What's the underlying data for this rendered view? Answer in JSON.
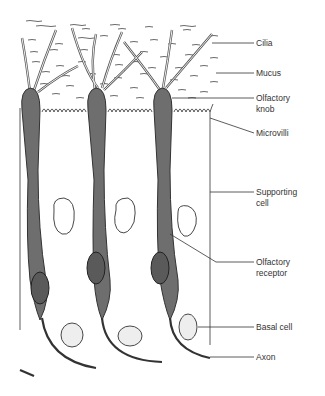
{
  "diagram": {
    "labels": {
      "cilia": "Cilia",
      "mucus": "Mucus",
      "olfactory_knob_1": "Olfactory",
      "olfactory_knob_2": "knob",
      "microvilli": "Microvilli",
      "supporting_cell_1": "Supporting",
      "supporting_cell_2": "cell",
      "olfactory_receptor_1": "Olfactory",
      "olfactory_receptor_2": "receptor",
      "basal_cell": "Basal cell",
      "axon": "Axon"
    },
    "colors": {
      "receptor_fill": "#6e6e6e",
      "outline": "#333333",
      "background": "#ffffff",
      "nucleus_dots": "#888888"
    }
  }
}
